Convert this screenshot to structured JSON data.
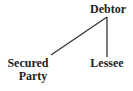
{
  "diagram": {
    "type": "tree",
    "nodes": {
      "root": {
        "label": "Debtor"
      },
      "left_child": {
        "label_line1": "Secured",
        "label_line2": "Party"
      },
      "right_child": {
        "label": "Lessee"
      }
    },
    "edges": [
      {
        "from": "Debtor",
        "to": "Secured Party"
      },
      {
        "from": "Debtor",
        "to": "Lessee"
      }
    ],
    "colors": {
      "text": "#222222",
      "line": "#333333",
      "background": "#ffffff"
    }
  }
}
